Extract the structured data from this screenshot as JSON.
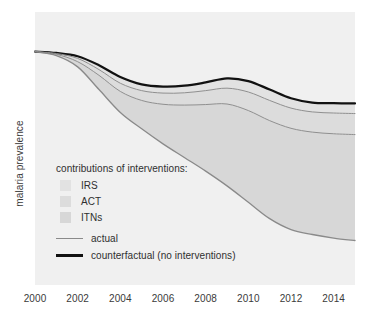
{
  "chart_data": {
    "type": "area",
    "title": "",
    "xlabel": "",
    "ylabel": "malaria prevalence",
    "xlim": [
      2000,
      2015
    ],
    "ylim": [
      0,
      1
    ],
    "grid": false,
    "x_tick_labels": [
      "2000",
      "2002",
      "2004",
      "2006",
      "2008",
      "2010",
      "2012",
      "2014"
    ],
    "x_tick_values": [
      2000,
      2002,
      2004,
      2006,
      2008,
      2010,
      2012,
      2014
    ],
    "y_tick_labels": [],
    "x": [
      2000,
      2001,
      2002,
      2003,
      2004,
      2005,
      2006,
      2007,
      2008,
      2009,
      2010,
      2011,
      2012,
      2013,
      2014,
      2015
    ],
    "series": [
      {
        "name": "counterfactual (no interventions)",
        "role": "upper-bound-line",
        "color": "#111111",
        "width": 2.2,
        "values": [
          0.855,
          0.85,
          0.838,
          0.805,
          0.762,
          0.735,
          0.727,
          0.73,
          0.742,
          0.757,
          0.747,
          0.716,
          0.684,
          0.668,
          0.666,
          0.665
        ]
      },
      {
        "name": "IRS lower boundary",
        "role": "band-divider",
        "color": "#8f8f8f",
        "width": 1.0,
        "values": [
          0.855,
          0.848,
          0.83,
          0.789,
          0.739,
          0.712,
          0.703,
          0.704,
          0.712,
          0.721,
          0.707,
          0.676,
          0.648,
          0.634,
          0.63,
          0.628
        ]
      },
      {
        "name": "ACT lower boundary",
        "role": "band-divider",
        "color": "#8f8f8f",
        "width": 1.0,
        "values": [
          0.855,
          0.845,
          0.818,
          0.768,
          0.709,
          0.676,
          0.662,
          0.659,
          0.661,
          0.663,
          0.639,
          0.602,
          0.574,
          0.56,
          0.554,
          0.551
        ]
      },
      {
        "name": "actual",
        "role": "lower-bound-line",
        "color": "#8a8a8a",
        "width": 1.3,
        "values": [
          0.855,
          0.84,
          0.799,
          0.716,
          0.632,
          0.572,
          0.517,
          0.467,
          0.417,
          0.363,
          0.303,
          0.243,
          0.203,
          0.185,
          0.172,
          0.163
        ]
      }
    ],
    "bands": [
      {
        "name": "IRS",
        "between": [
          "counterfactual (no interventions)",
          "IRS lower boundary"
        ],
        "color": "#e2e2e2"
      },
      {
        "name": "ACT",
        "between": [
          "IRS lower boundary",
          "ACT lower boundary"
        ],
        "color": "#dcdcdc"
      },
      {
        "name": "ITNs",
        "between": [
          "ACT lower boundary",
          "actual"
        ],
        "color": "#d7d7d7"
      }
    ],
    "plot_background": "#f0f0f0",
    "figure_background": "#ffffff"
  },
  "axes": {
    "y_axis_label": "malaria prevalence",
    "x_tick_labels": [
      "2000",
      "2002",
      "2004",
      "2006",
      "2008",
      "2010",
      "2012",
      "2014"
    ]
  },
  "legend": {
    "title": "contributions of interventions:",
    "swatches": [
      {
        "label": "IRS",
        "color": "#e2e2e2"
      },
      {
        "label": "ACT",
        "color": "#dcdcdc"
      },
      {
        "label": "ITNs",
        "color": "#d7d7d7"
      }
    ],
    "lines": [
      {
        "label": "actual",
        "color": "#8a8a8a",
        "thickness": "1.5px"
      },
      {
        "label": "counterfactual (no interventions)",
        "color": "#111111",
        "thickness": "2.6px"
      }
    ]
  },
  "colors": {
    "plot_background": "#f0f0f0",
    "page_background": "#ffffff",
    "text": "#2f2f2f",
    "counterfactual_line": "#111111",
    "actual_line": "#8a8a8a",
    "band_irs": "#e2e2e2",
    "band_act": "#dcdcdc",
    "band_itns": "#d7d7d7"
  }
}
